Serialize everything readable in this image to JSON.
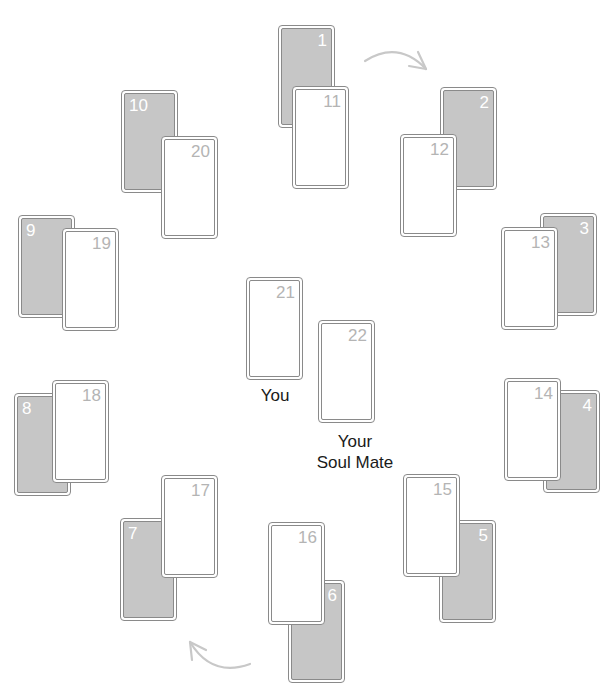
{
  "cards": [
    {
      "id": "1",
      "side": "back",
      "numPos": "right"
    },
    {
      "id": "2",
      "side": "back",
      "numPos": "right"
    },
    {
      "id": "3",
      "side": "back",
      "numPos": "right"
    },
    {
      "id": "4",
      "side": "back",
      "numPos": "right"
    },
    {
      "id": "5",
      "side": "back",
      "numPos": "right"
    },
    {
      "id": "6",
      "side": "back",
      "numPos": "right"
    },
    {
      "id": "7",
      "side": "back",
      "numPos": "left"
    },
    {
      "id": "8",
      "side": "back",
      "numPos": "left"
    },
    {
      "id": "9",
      "side": "back",
      "numPos": "left"
    },
    {
      "id": "10",
      "side": "back",
      "numPos": "left"
    },
    {
      "id": "11",
      "side": "front",
      "numPos": "right"
    },
    {
      "id": "12",
      "side": "front",
      "numPos": "right"
    },
    {
      "id": "13",
      "side": "front",
      "numPos": "right"
    },
    {
      "id": "14",
      "side": "front",
      "numPos": "right"
    },
    {
      "id": "15",
      "side": "front",
      "numPos": "right"
    },
    {
      "id": "16",
      "side": "front",
      "numPos": "right"
    },
    {
      "id": "17",
      "side": "front",
      "numPos": "right"
    },
    {
      "id": "18",
      "side": "front",
      "numPos": "right"
    },
    {
      "id": "19",
      "side": "front",
      "numPos": "right"
    },
    {
      "id": "20",
      "side": "front",
      "numPos": "right"
    },
    {
      "id": "21",
      "side": "front",
      "numPos": "right"
    },
    {
      "id": "22",
      "side": "front",
      "numPos": "right"
    }
  ],
  "labels": {
    "you": "You",
    "soul_mate_line1": "Your",
    "soul_mate_line2": "Soul Mate"
  },
  "arrows": [
    {
      "name": "clockwise-arrow-top",
      "direction": "clockwise"
    },
    {
      "name": "clockwise-arrow-bottom",
      "direction": "clockwise"
    }
  ],
  "colors": {
    "card_back": "#c6c6c6",
    "card_border": "#8a8a8a",
    "front_number": "#b4b4b4",
    "arrow": "#c8c8c8"
  }
}
